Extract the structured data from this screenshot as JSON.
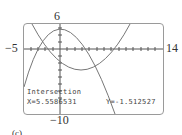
{
  "window": {
    "xmin": -5,
    "xmax": 14,
    "ymin": -10,
    "ymax": 6,
    "xmin_label": "−5",
    "xmax_label": "14",
    "ymin_label": "−10",
    "ymax_label": "6"
  },
  "readout": {
    "title": "Intersection",
    "x": "X=5.5586531",
    "y": "Y=-1.512527"
  },
  "caption": "(c)",
  "colors": {
    "curve": "#777777",
    "axis": "#555555",
    "frame": "#9a9a9a"
  }
}
